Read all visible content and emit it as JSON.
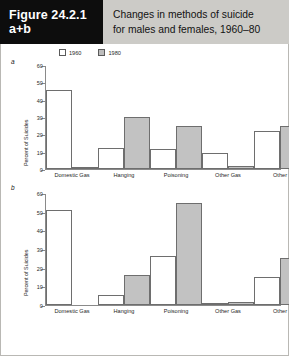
{
  "header": {
    "figure_number_line1": "Figure 24.2.1",
    "figure_number_line2": "a+b",
    "title_line1": "Changes in methods of suicide",
    "title_line2": "for males and females, 1960–80"
  },
  "legend": {
    "items": [
      {
        "label": "1960",
        "swatch": "white"
      },
      {
        "label": "1980",
        "swatch": "gray"
      }
    ]
  },
  "panels": [
    {
      "id": "a",
      "label": "a",
      "ylabel": "Percent of Suicides"
    },
    {
      "id": "b",
      "label": "b",
      "ylabel": "Percent of Suicides"
    }
  ],
  "colors": {
    "header_box": "#0d0d0d",
    "header_band": "#cccbc7",
    "bar_1960": "#ffffff",
    "bar_1980": "#c2c2c2",
    "bar_outline": "#6e6e6e",
    "axis": "#8a8a8a"
  },
  "chart_data": [
    {
      "type": "bar",
      "panel": "a",
      "title": "",
      "xlabel": "",
      "ylabel": "Percent of Suicides",
      "ylim": [
        0,
        60
      ],
      "yticks": [
        0,
        10,
        20,
        30,
        40,
        50,
        60
      ],
      "grid": false,
      "legend_position": "top-left",
      "categories": [
        "Domestic Gas",
        "Hanging",
        "Poisoning",
        "Other Gas",
        "Other"
      ],
      "series": [
        {
          "name": "1960",
          "values": [
            45.5,
            12,
            11.5,
            9,
            22
          ]
        },
        {
          "name": "1980",
          "values": [
            0.5,
            30,
            25,
            2,
            25
          ]
        }
      ]
    },
    {
      "type": "bar",
      "panel": "b",
      "title": "",
      "xlabel": "",
      "ylabel": "Percent of Suicides",
      "ylim": [
        0,
        60
      ],
      "yticks": [
        0,
        10,
        20,
        30,
        40,
        50,
        60
      ],
      "grid": false,
      "legend_position": "top-left",
      "categories": [
        "Domestic Gas",
        "Hanging",
        "Poisoning",
        "Other Gas",
        "Other"
      ],
      "series": [
        {
          "name": "1960",
          "values": [
            51,
            5.5,
            26,
            1,
            15
          ]
        },
        {
          "name": "1980",
          "values": [
            0,
            16,
            54.5,
            1.5,
            25
          ]
        }
      ]
    }
  ]
}
